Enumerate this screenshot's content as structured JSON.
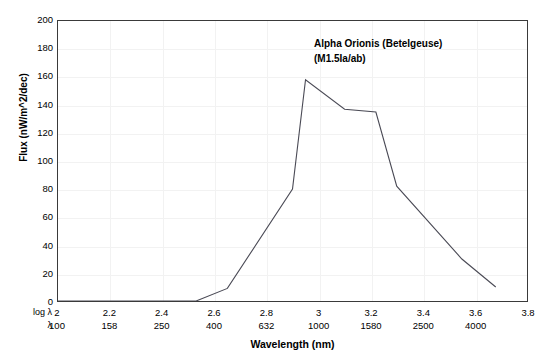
{
  "chart_data": {
    "type": "line",
    "title": "",
    "annotation_lines": [
      "Alpha Orionis (Betelgeuse)",
      "(M1.5Ia/ab)"
    ],
    "xlabel": "Wavelength (nm)",
    "ylabel": "Flux (nW/m^2/dec)",
    "x_row1_caption": "log λ",
    "x_row2_caption": "λ",
    "xlim": [
      2,
      3.8
    ],
    "ylim": [
      0,
      200
    ],
    "grid": true,
    "legend": "none",
    "line_color": "#4a4a55",
    "x_ticks_log": [
      "2",
      "2.2",
      "2.4",
      "2.6",
      "2.8",
      "3",
      "3.2",
      "3.4",
      "3.6",
      "3.8"
    ],
    "x_ticks_nm": [
      "100",
      "158",
      "250",
      "400",
      "632",
      "1000",
      "1580",
      "2500",
      "4000"
    ],
    "y_ticks": [
      "0",
      "20",
      "40",
      "60",
      "80",
      "100",
      "120",
      "140",
      "160",
      "180",
      "200"
    ],
    "x": [
      2.0,
      2.53,
      2.65,
      2.9,
      2.95,
      3.1,
      3.22,
      3.3,
      3.55,
      3.68
    ],
    "y": [
      0,
      0,
      9,
      80,
      158,
      137,
      135,
      82,
      30,
      10
    ],
    "points": [
      {
        "log_lambda": 2.0,
        "lambda_nm": 100,
        "flux": 0
      },
      {
        "log_lambda": 2.53,
        "lambda_nm": 339,
        "flux": 0
      },
      {
        "log_lambda": 2.65,
        "lambda_nm": 447,
        "flux": 9
      },
      {
        "log_lambda": 2.9,
        "lambda_nm": 794,
        "flux": 80
      },
      {
        "log_lambda": 2.95,
        "lambda_nm": 891,
        "flux": 158
      },
      {
        "log_lambda": 3.1,
        "lambda_nm": 1259,
        "flux": 137
      },
      {
        "log_lambda": 3.22,
        "lambda_nm": 1660,
        "flux": 135
      },
      {
        "log_lambda": 3.3,
        "lambda_nm": 1995,
        "flux": 82
      },
      {
        "log_lambda": 3.55,
        "lambda_nm": 3548,
        "flux": 30
      },
      {
        "log_lambda": 3.68,
        "lambda_nm": 4786,
        "flux": 10
      }
    ]
  }
}
